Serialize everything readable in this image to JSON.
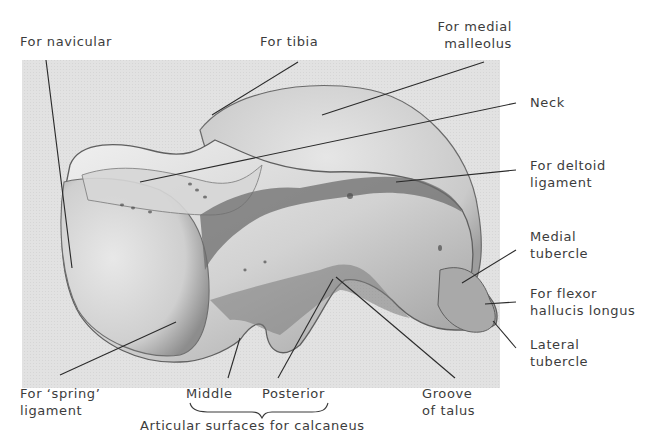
{
  "figure": {
    "background_color": "#e4e4e4",
    "bone_light": "#ececec",
    "bone_mid": "#b9b9b9",
    "bone_dark": "#5a5a5a",
    "leader_color": "#2a2a2a",
    "text_color": "#3c3c3c"
  },
  "labels": {
    "navicular": {
      "line1": "For navicular"
    },
    "tibia": {
      "line1": "For tibia"
    },
    "medial_malleolus": {
      "line1": "For medial",
      "line2": "malleolus"
    },
    "neck": {
      "line1": "Neck"
    },
    "deltoid": {
      "line1": "For deltoid",
      "line2": "ligament"
    },
    "medial_tubercle": {
      "line1": "Medial",
      "line2": "tubercle"
    },
    "flexor": {
      "line1": "For flexor",
      "line2": "hallucis longus"
    },
    "lateral_tubercle": {
      "line1": "Lateral",
      "line2": "tubercle"
    },
    "spring": {
      "line1": "For ‘spring’",
      "line2": "ligament"
    },
    "middle": {
      "line1": "Middle"
    },
    "posterior": {
      "line1": "Posterior"
    },
    "groove": {
      "line1": "Groove",
      "line2": "of talus"
    },
    "articular": {
      "line1": "Articular surfaces for calcaneus"
    }
  }
}
